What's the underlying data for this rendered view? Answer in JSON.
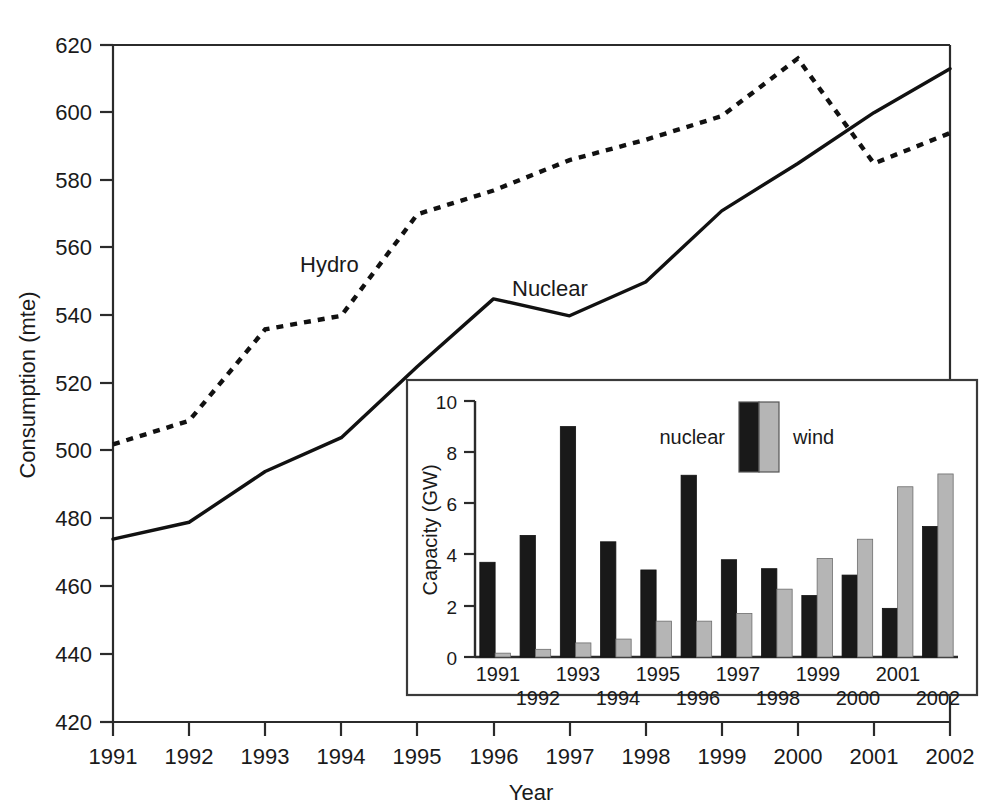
{
  "chart_data": [
    {
      "id": "main",
      "type": "line",
      "title": "",
      "xlabel": "Year",
      "ylabel": "Consumption (mte)",
      "x": [
        1991,
        1992,
        1993,
        1994,
        1995,
        1996,
        1997,
        1998,
        1999,
        2000,
        2001,
        2002
      ],
      "xticklabels": [
        "1991",
        "1992",
        "1993",
        "1994",
        "1995",
        "1996",
        "1997",
        "1998",
        "1999",
        "2000",
        "2001",
        "2002"
      ],
      "yticks": [
        420,
        440,
        460,
        480,
        500,
        520,
        540,
        560,
        580,
        600,
        620
      ],
      "yticklabels": [
        "420",
        "440",
        "460",
        "480",
        "500",
        "520",
        "540",
        "560",
        "580",
        "600",
        "620"
      ],
      "ylim": [
        420,
        620
      ],
      "xlim": [
        1991,
        2002
      ],
      "grid": false,
      "legend_position": "inline-annotations",
      "series": [
        {
          "name": "Hydro",
          "style": "dashed",
          "label_text": "Hydro",
          "values": [
            502,
            509,
            536,
            540,
            570,
            577,
            586,
            592,
            599,
            616,
            585,
            594
          ]
        },
        {
          "name": "Nuclear",
          "style": "solid",
          "label_text": "Nuclear",
          "values": [
            474,
            479,
            494,
            504,
            525,
            545,
            540,
            550,
            571,
            585,
            600,
            613
          ]
        }
      ]
    },
    {
      "id": "inset",
      "type": "bar",
      "title": "",
      "xlabel": "",
      "ylabel": "Capacity (GW)",
      "categories": [
        "1991",
        "1992",
        "1993",
        "1994",
        "1995",
        "1996",
        "1997",
        "1998",
        "1999",
        "2000",
        "2001",
        "2002"
      ],
      "yticks": [
        0,
        2,
        4,
        6,
        8,
        10
      ],
      "yticklabels": [
        "0",
        "2",
        "4",
        "6",
        "8",
        "10"
      ],
      "ylim": [
        0,
        10
      ],
      "grid": false,
      "legend_position": "upper-right-inside",
      "series": [
        {
          "name": "nuclear",
          "color": "#191919",
          "values": [
            3.7,
            4.75,
            9.0,
            4.5,
            3.4,
            7.1,
            3.8,
            3.45,
            2.4,
            3.2,
            1.9,
            5.1
          ]
        },
        {
          "name": "wind",
          "color": "#b5b5b5",
          "values": [
            0.15,
            0.3,
            0.55,
            0.7,
            1.4,
            1.4,
            1.7,
            2.65,
            3.85,
            4.6,
            6.65,
            7.15
          ]
        }
      ]
    }
  ],
  "main_chart": {
    "ylabel": "Consumption (mte)",
    "xlabel": "Year",
    "ytick_labels": [
      "620",
      "600",
      "580",
      "560",
      "540",
      "520",
      "500",
      "480",
      "460",
      "440",
      "420"
    ],
    "xtick_labels": [
      "1991",
      "1992",
      "1993",
      "1994",
      "1995",
      "1996",
      "1997",
      "1998",
      "1999",
      "2000",
      "2001",
      "2002"
    ],
    "hydro_label": "Hydro",
    "nuclear_label": "Nuclear"
  },
  "inset_chart": {
    "ylabel": "Capacity (GW)",
    "ytick_labels": [
      "10",
      "8",
      "6",
      "4",
      "2",
      "0"
    ],
    "xtick_labels_top": [
      "1991",
      "1993",
      "1995",
      "1997",
      "1999",
      "2001"
    ],
    "xtick_labels_bottom": [
      "1992",
      "1994",
      "1996",
      "1998",
      "2000",
      "2002"
    ],
    "legend": {
      "nuclear_label": "nuclear",
      "wind_label": "wind"
    }
  },
  "colors": {
    "ink": "#1a1a1a",
    "axis": "#2b2b2b",
    "nuclear_bar": "#191919",
    "wind_bar": "#b5b5b5",
    "background": "#ffffff"
  }
}
